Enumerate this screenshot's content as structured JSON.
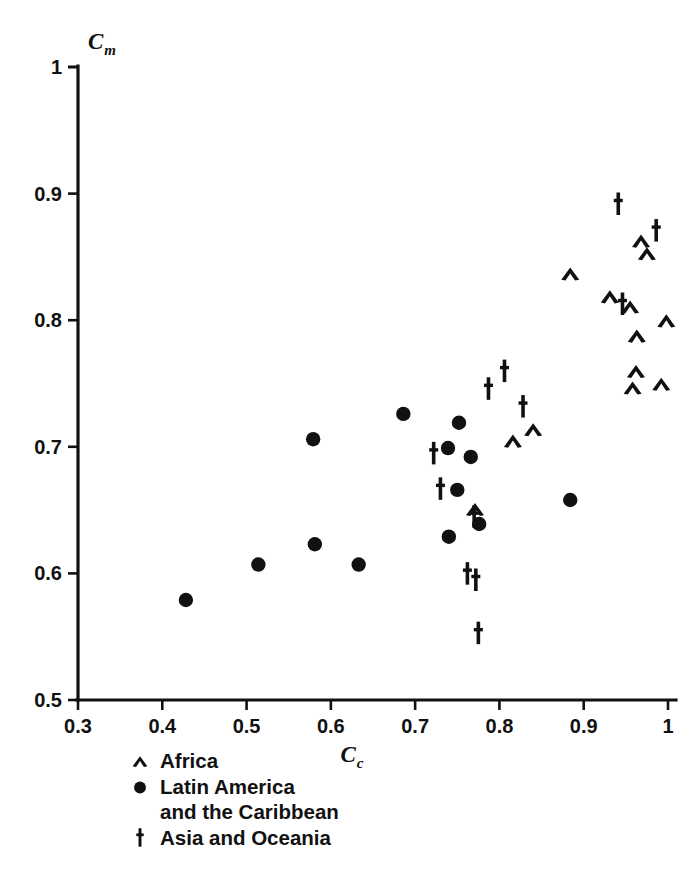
{
  "figure": {
    "background": "#ffffff",
    "ink_color": "#111111"
  },
  "chart_data": {
    "type": "scatter",
    "title": "",
    "xlabel": "C_c",
    "xlabel_base": "C",
    "xlabel_sub": "c",
    "ylabel": "C_m",
    "ylabel_base": "C",
    "ylabel_sub": "m",
    "xlim": [
      0.3,
      1.0
    ],
    "ylim": [
      0.5,
      1.0
    ],
    "xticks": [
      0.3,
      0.4,
      0.5,
      0.6,
      0.7,
      0.8,
      0.9,
      1.0
    ],
    "xticklabels": [
      "0.3",
      "0.4",
      "0.5",
      "0.6",
      "0.7",
      "0.8",
      "0.9",
      "1"
    ],
    "yticks": [
      0.5,
      0.6,
      0.7,
      0.8,
      0.9,
      1.0
    ],
    "yticklabels": [
      "0.5",
      "0.6",
      "0.7",
      "0.8",
      "0.9",
      "1"
    ],
    "grid": false,
    "legend_position": "below-axes-left",
    "marker_color": "#111111",
    "series": [
      {
        "name": "Africa",
        "marker": "chevron",
        "points": [
          [
            0.884,
            0.836
          ],
          [
            0.931,
            0.818
          ],
          [
            0.955,
            0.81
          ],
          [
            0.963,
            0.787
          ],
          [
            0.975,
            0.852
          ],
          [
            0.968,
            0.862
          ],
          [
            0.998,
            0.799
          ],
          [
            0.962,
            0.759
          ],
          [
            0.958,
            0.746
          ],
          [
            0.992,
            0.749
          ],
          [
            0.816,
            0.704
          ],
          [
            0.84,
            0.713
          ],
          [
            0.771,
            0.65
          ]
        ]
      },
      {
        "name": "Latin America and the Caribbean",
        "marker": "circle",
        "points": [
          [
            0.428,
            0.579
          ],
          [
            0.514,
            0.607
          ],
          [
            0.579,
            0.706
          ],
          [
            0.581,
            0.623
          ],
          [
            0.633,
            0.607
          ],
          [
            0.686,
            0.726
          ],
          [
            0.739,
            0.699
          ],
          [
            0.752,
            0.719
          ],
          [
            0.766,
            0.692
          ],
          [
            0.75,
            0.666
          ],
          [
            0.74,
            0.629
          ],
          [
            0.776,
            0.639
          ],
          [
            0.884,
            0.658
          ]
        ]
      },
      {
        "name": "Asia and Oceania",
        "marker": "dagger",
        "points": [
          [
            0.722,
            0.694
          ],
          [
            0.73,
            0.666
          ],
          [
            0.77,
            0.644
          ],
          [
            0.762,
            0.599
          ],
          [
            0.772,
            0.594
          ],
          [
            0.775,
            0.552
          ],
          [
            0.787,
            0.745
          ],
          [
            0.806,
            0.759
          ],
          [
            0.828,
            0.731
          ],
          [
            0.941,
            0.891
          ],
          [
            0.946,
            0.812
          ],
          [
            0.986,
            0.87
          ]
        ]
      }
    ]
  },
  "legend": {
    "entries": [
      {
        "marker": "chevron",
        "label": "Africa"
      },
      {
        "marker": "circle",
        "label": "Latin America"
      },
      {
        "marker": "none",
        "label": "and the Caribbean"
      },
      {
        "marker": "dagger",
        "label": "Asia and Oceania"
      }
    ]
  }
}
